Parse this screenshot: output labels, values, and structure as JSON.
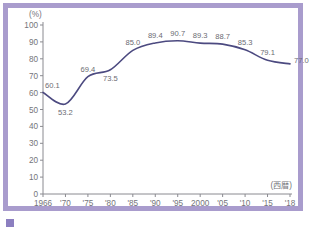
{
  "frame": {
    "border_color": "#a99ccd"
  },
  "caption": {
    "marker": "",
    "text": ""
  },
  "chart_data": {
    "type": "line",
    "title": "",
    "xlabel": "(西暦)",
    "ylabel": "(%)",
    "ylim": [
      0,
      100
    ],
    "ytick_labels": [
      "100",
      "90",
      "80",
      "70",
      "60",
      "50",
      "40",
      "30",
      "20",
      "10",
      "0"
    ],
    "ytick_values": [
      100,
      90,
      80,
      70,
      60,
      50,
      40,
      30,
      20,
      10,
      0
    ],
    "categories": [
      "1966",
      "'70",
      "'75",
      "'80",
      "'85",
      "'90",
      "'95",
      "2000",
      "'05",
      "'10",
      "'15",
      "'18"
    ],
    "values": [
      60.1,
      53.2,
      69.4,
      73.5,
      85.0,
      89.4,
      90.7,
      89.3,
      88.7,
      85.3,
      79.1,
      77.0
    ],
    "point_labels": [
      "60.1",
      "53.2",
      "69.4",
      "73.5",
      "85.0",
      "89.4",
      "90.7",
      "89.3",
      "88.7",
      "85.3",
      "79.1",
      "77.0"
    ],
    "label_positions": [
      "left-above",
      "below",
      "above",
      "below",
      "above",
      "above",
      "above",
      "above",
      "above",
      "above",
      "above",
      "right"
    ],
    "line_color": "#4c4a80",
    "grid": false,
    "legend": null,
    "axis_color": "#8a8a90"
  }
}
